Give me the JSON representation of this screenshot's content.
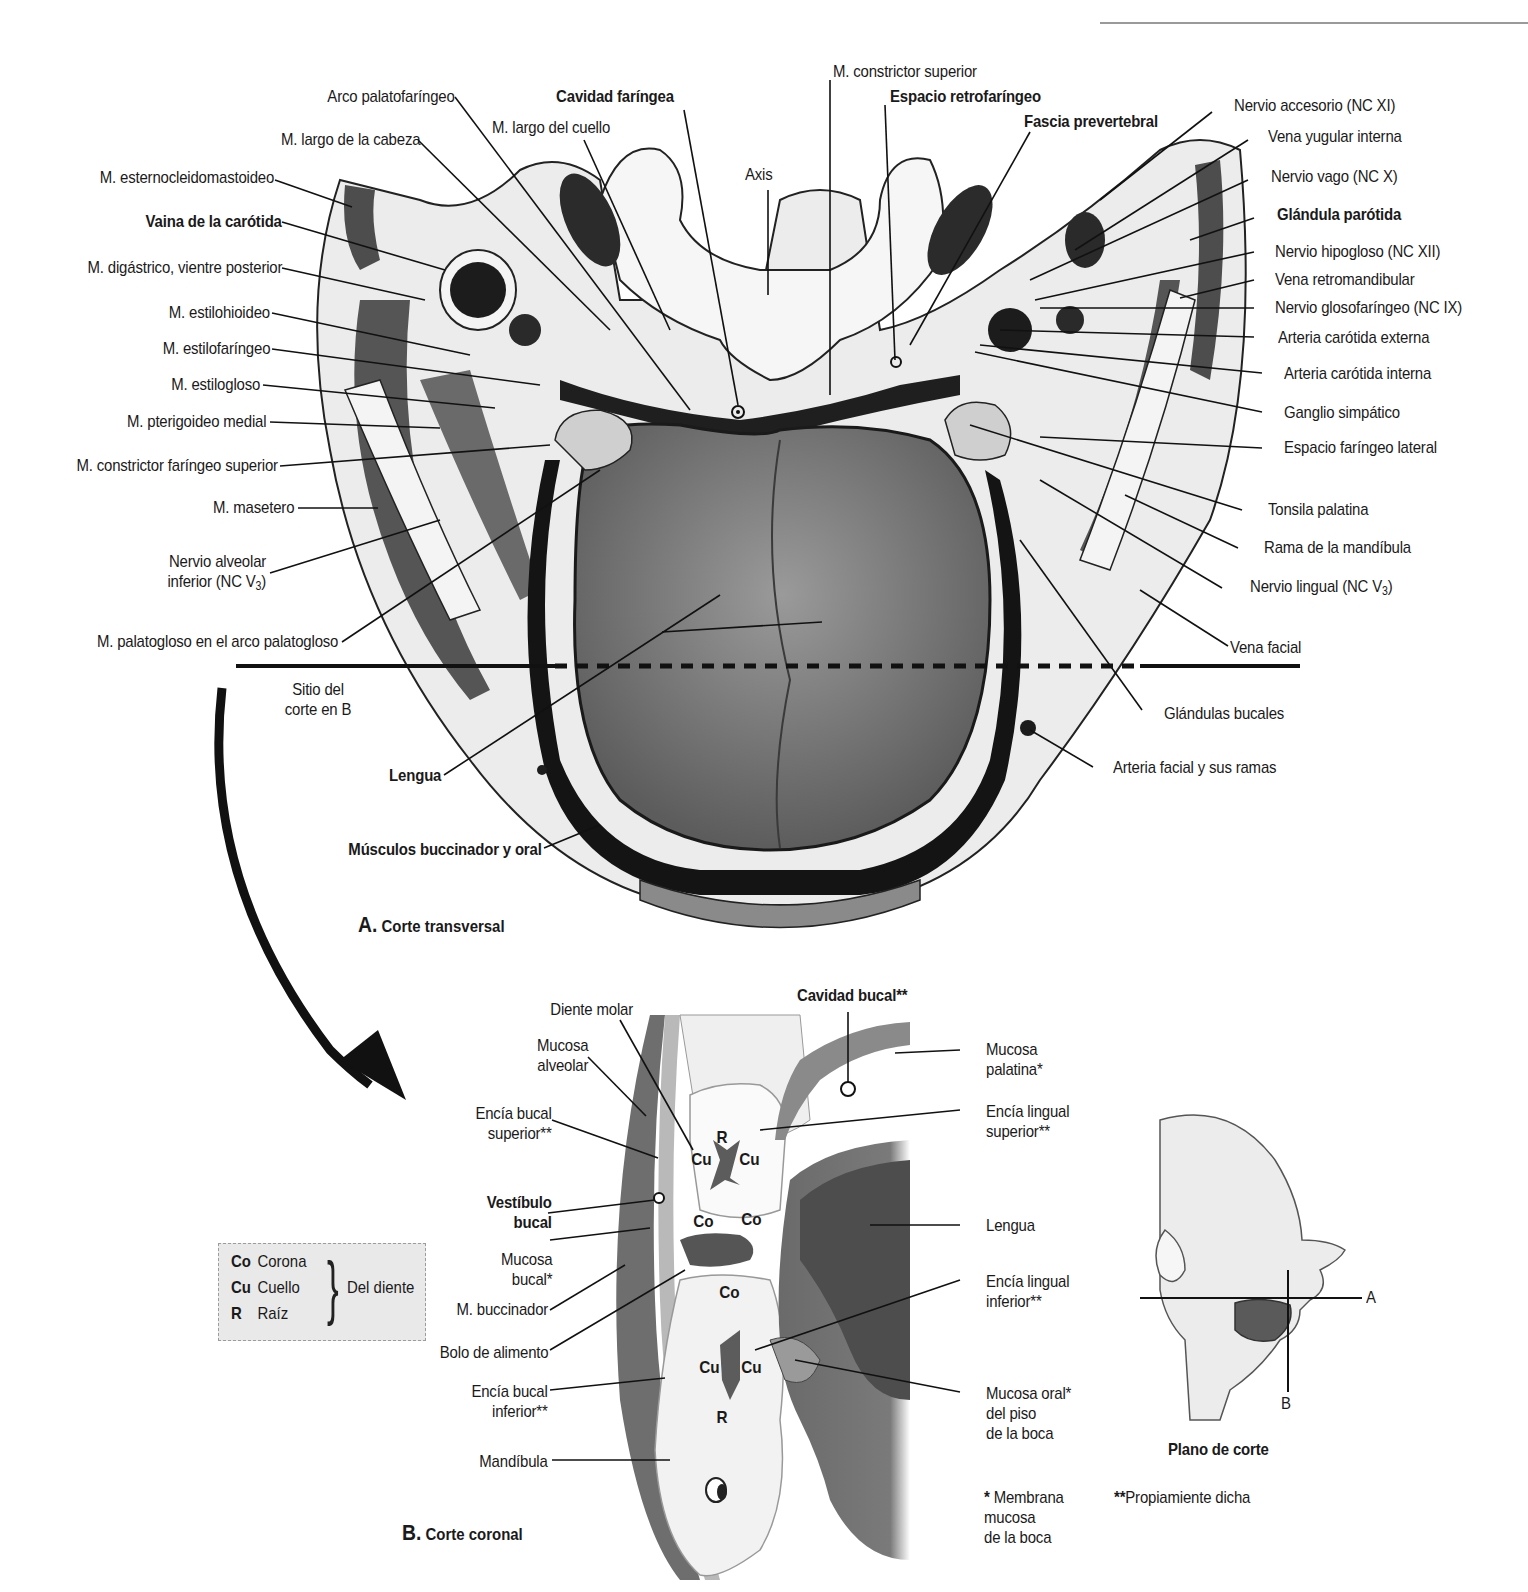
{
  "figure": {
    "panel_a": {
      "letter": "A.",
      "title": "Corte transversal",
      "labels_left": [
        {
          "id": "arco-palatofaringeo",
          "text": "Arco palatofaríngeo",
          "bold": false
        },
        {
          "id": "m-largo-cabeza",
          "text": "M. largo de la cabeza",
          "bold": false
        },
        {
          "id": "m-esternocleidomastoideo",
          "text": "M. esternocleidomastoideo",
          "bold": false
        },
        {
          "id": "vaina-carotida",
          "text": "Vaina de la carótida",
          "bold": true
        },
        {
          "id": "m-digastrico",
          "text": "M. digástrico, vientre posterior",
          "bold": false
        },
        {
          "id": "m-estilohioideo",
          "text": "M. estilohioideo",
          "bold": false
        },
        {
          "id": "m-estilofaringeo",
          "text": "M. estilofaríngeo",
          "bold": false
        },
        {
          "id": "m-estilogloso",
          "text": "M. estilogloso",
          "bold": false
        },
        {
          "id": "m-pterigoideo-medial",
          "text": "M. pterigoideo medial",
          "bold": false
        },
        {
          "id": "m-constrictor-faringeo-superior",
          "text": "M. constrictor faríngeo superior",
          "bold": false
        },
        {
          "id": "m-masetero",
          "text": "M. masetero",
          "bold": false
        },
        {
          "id": "nervio-alveolar-inferior",
          "text": "Nervio alveolar\ninferior (NC V",
          "sub": "3",
          "suffix": ")",
          "bold": false
        },
        {
          "id": "m-palatogloso",
          "text": "M. palatogloso en el arco palatogloso",
          "bold": false
        }
      ],
      "labels_top": [
        {
          "id": "cavidad-faringea",
          "text": "Cavidad faríngea",
          "bold": true
        },
        {
          "id": "m-largo-cuello",
          "text": "M. largo del cuello",
          "bold": false
        },
        {
          "id": "axis",
          "text": "Axis",
          "bold": false
        },
        {
          "id": "m-constrictor-superior",
          "text": "M. constrictor superior",
          "bold": false
        },
        {
          "id": "espacio-retrofaringeo",
          "text": "Espacio retrofaríngeo",
          "bold": true
        },
        {
          "id": "fascia-prevertebral",
          "text": "Fascia prevertebral",
          "bold": true
        }
      ],
      "labels_right": [
        {
          "id": "nervio-accesorio",
          "text": "Nervio accesorio (NC XI)",
          "bold": false
        },
        {
          "id": "vena-yugular-interna",
          "text": "Vena yugular interna",
          "bold": false
        },
        {
          "id": "nervio-vago",
          "text": "Nervio vago (NC X)",
          "bold": false
        },
        {
          "id": "glandula-parotida",
          "text": "Glándula parótida",
          "bold": true
        },
        {
          "id": "nervio-hipogloso",
          "text": "Nervio hipogloso (NC XII)",
          "bold": false
        },
        {
          "id": "vena-retromandibular",
          "text": "Vena retromandibular",
          "bold": false
        },
        {
          "id": "nervio-glosofaringeo",
          "text": "Nervio glosofaríngeo (NC IX)",
          "bold": false
        },
        {
          "id": "arteria-carotida-externa",
          "text": "Arteria carótida externa",
          "bold": false
        },
        {
          "id": "arteria-carotida-interna",
          "text": "Arteria carótida interna",
          "bold": false
        },
        {
          "id": "ganglio-simpatico",
          "text": "Ganglio simpático",
          "bold": false
        },
        {
          "id": "espacio-faringeo-lateral",
          "text": "Espacio faríngeo lateral",
          "bold": false
        },
        {
          "id": "tonsila-palatina",
          "text": "Tonsila palatina",
          "bold": false
        },
        {
          "id": "rama-mandibula",
          "text": "Rama de la mandíbula",
          "bold": false
        },
        {
          "id": "nervio-lingual",
          "text": "Nervio lingual (NC V",
          "sub": "3",
          "suffix": ")",
          "bold": false
        },
        {
          "id": "vena-facial",
          "text": "Vena facial",
          "bold": false
        },
        {
          "id": "glandulas-bucales",
          "text": "Glándulas bucales",
          "bold": false
        },
        {
          "id": "arteria-facial",
          "text": "Arteria facial y sus ramas",
          "bold": false
        }
      ],
      "labels_bottom": [
        {
          "id": "sitio-corte-b",
          "text": "Sitio del\ncorte en B",
          "bold": false
        },
        {
          "id": "lengua",
          "text": "Lengua",
          "bold": true
        },
        {
          "id": "musculos-buccinador-oral",
          "text": "Músculos buccinador y oral",
          "bold": true
        }
      ],
      "signature": "E. Blackstock"
    },
    "panel_b": {
      "letter": "B.",
      "title": "Corte coronal",
      "labels_left": [
        {
          "id": "diente-molar",
          "text": "Diente molar",
          "bold": false
        },
        {
          "id": "mucosa-alveolar",
          "text": "Mucosa\nalveolar",
          "bold": false
        },
        {
          "id": "encia-bucal-superior",
          "text": "Encía bucal\nsuperior**",
          "bold": false
        },
        {
          "id": "vestibulo-bucal",
          "text": "Vestíbulo\nbucal",
          "bold": true
        },
        {
          "id": "mucosa-bucal",
          "text": "Mucosa\nbucal*",
          "bold": false
        },
        {
          "id": "m-buccinador",
          "text": "M. buccinador",
          "bold": false
        },
        {
          "id": "bolo-alimento",
          "text": "Bolo de alimento",
          "bold": false
        },
        {
          "id": "encia-bucal-inferior",
          "text": "Encía bucal\ninferior**",
          "bold": false
        },
        {
          "id": "mandibula",
          "text": "Mandíbula",
          "bold": false
        }
      ],
      "labels_top": [
        {
          "id": "cavidad-bucal",
          "text": "Cavidad bucal**",
          "bold": true
        }
      ],
      "labels_right": [
        {
          "id": "mucosa-palatina",
          "text": "Mucosa\npalatina*",
          "bold": false
        },
        {
          "id": "encia-lingual-superior",
          "text": "Encía lingual\nsuperior**",
          "bold": false
        },
        {
          "id": "lengua-b",
          "text": "Lengua",
          "bold": false
        },
        {
          "id": "encia-lingual-inferior",
          "text": "Encía lingual\ninferior**",
          "bold": false
        },
        {
          "id": "mucosa-oral-piso",
          "text": "Mucosa oral*\ndel piso\nde la boca",
          "bold": false
        }
      ],
      "tooth_marks": {
        "upper": [
          "R",
          "Cu",
          "Cu",
          "Co",
          "Co"
        ],
        "lower": [
          "Co",
          "Cu",
          "Cu",
          "R"
        ]
      },
      "footnote_single": {
        "mark": "*",
        "text": "Membrana\nmucosa\nde la boca"
      },
      "footnote_double": {
        "mark": "**",
        "text": "Propiamiente dicha"
      }
    },
    "legend": {
      "rows": [
        {
          "abbr": "Co",
          "term": "Corona"
        },
        {
          "abbr": "Cu",
          "term": "Cuello"
        },
        {
          "abbr": "R",
          "term": "Raíz"
        }
      ],
      "group_label": "Del diente"
    },
    "orientation_inset": {
      "title": "Plano de corte",
      "plane_a": "A",
      "plane_b": "B"
    }
  },
  "colors": {
    "ink": "#1a1a1a",
    "muscle": "#5a5a5a",
    "tongue": "#7a7a7a",
    "soft_tissue": "#d6d6d6",
    "bone": "#f2f2f2",
    "vessel_dark": "#222222",
    "legend_bg": "#e9e9e9"
  }
}
